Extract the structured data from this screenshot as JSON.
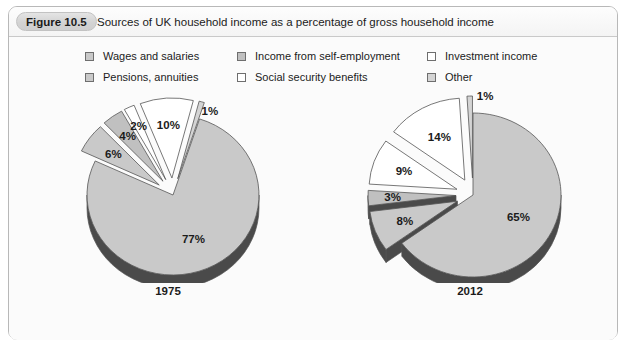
{
  "figure": {
    "badge": "Figure 10.5",
    "caption": "Sources of UK household income as a percentage of gross household income"
  },
  "legend": {
    "columns": [
      {
        "items": [
          {
            "label": "Wages and salaries",
            "color": "#c9c9c9"
          },
          {
            "label": "Pensions, annuities",
            "color": "#c9c9c9"
          }
        ]
      },
      {
        "items": [
          {
            "label": "Income from self-employment",
            "color": "#c0c0c0"
          },
          {
            "label": "Social security benefits",
            "color": "#ffffff"
          }
        ]
      },
      {
        "items": [
          {
            "label": "Investment income",
            "color": "#ffffff"
          },
          {
            "label": "Other",
            "color": "#d4d4d4"
          }
        ]
      }
    ]
  },
  "chart_data": [
    {
      "type": "pie",
      "title": "1975",
      "categories": [
        "Wages and salaries",
        "Pensions, annuities",
        "Income from self-employment",
        "Social security benefits",
        "Investment income",
        "Other"
      ],
      "values": [
        77,
        6,
        4,
        2,
        10,
        1
      ],
      "labels": [
        "77%",
        "6%",
        "4%",
        "2%",
        "10%",
        "1%"
      ],
      "colors": [
        "#c9c9c9",
        "#c9c9c9",
        "#c0c0c0",
        "#ffffff",
        "#ffffff",
        "#d4d4d4"
      ],
      "exploded": [
        false,
        true,
        true,
        true,
        true,
        true
      ],
      "legend_position": "top"
    },
    {
      "type": "pie",
      "title": "2012",
      "categories": [
        "Wages and salaries",
        "Pensions, annuities",
        "Income from self-employment",
        "Social security benefits",
        "Investment income",
        "Other"
      ],
      "values": [
        65,
        8,
        3,
        9,
        14,
        1
      ],
      "labels": [
        "65%",
        "8%",
        "3%",
        "9%",
        "14%",
        "1%"
      ],
      "colors": [
        "#c9c9c9",
        "#c9c9c9",
        "#c0c0c0",
        "#ffffff",
        "#ffffff",
        "#d4d4d4"
      ],
      "exploded": [
        false,
        true,
        true,
        true,
        true,
        true
      ],
      "legend_position": "top"
    }
  ],
  "years": {
    "left": "1975",
    "right": "2012"
  },
  "colors": {
    "frame_border": "#b8b8b8",
    "panel_bg": "#fbfbfb",
    "badge_bg": "#d3d3d3",
    "slice_edge": "#555555",
    "depth_shadow": "#4a4a4a",
    "text": "#1b1b1b"
  }
}
